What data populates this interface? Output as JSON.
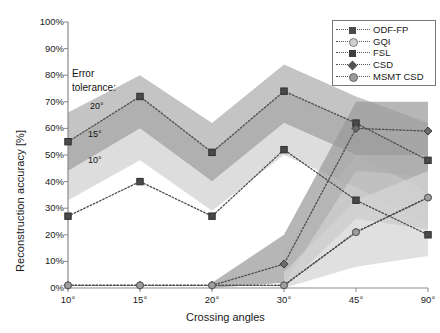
{
  "chart_data": {
    "type": "line",
    "title": "",
    "xlabel": "Crossing angles",
    "ylabel": "Reconstruction accuracy [%]",
    "categories": [
      "10°",
      "15°",
      "20°",
      "30°",
      "45°",
      "90°"
    ],
    "ylim": [
      0,
      100
    ],
    "yticks": [
      "0%",
      "10%",
      "20%",
      "30%",
      "40%",
      "50%",
      "60%",
      "70%",
      "80%",
      "90%",
      "100%"
    ],
    "ytick_values": [
      0,
      10,
      20,
      30,
      40,
      50,
      60,
      70,
      80,
      90,
      100
    ],
    "grid": false,
    "legend_position": "top-right",
    "series": [
      {
        "name": "ODF-FP",
        "marker": "square",
        "values": [
          55,
          72,
          51,
          74,
          62,
          48
        ]
      },
      {
        "name": "GQI",
        "marker": "circle",
        "values": [
          1,
          1,
          1,
          1,
          21,
          34
        ]
      },
      {
        "name": "FSL",
        "marker": "square",
        "values": [
          27,
          40,
          27,
          52,
          33,
          20
        ]
      },
      {
        "name": "CSD",
        "marker": "diamond",
        "values": [
          1,
          1,
          1,
          9,
          60,
          59
        ]
      },
      {
        "name": "MSMT CSD",
        "marker": "hexagon",
        "values": [
          1,
          1,
          1,
          1,
          21,
          34
        ]
      }
    ],
    "bands": [
      {
        "label": "20°",
        "upper": [
          66,
          80,
          62,
          84,
          72,
          62
        ],
        "lower": [
          55,
          72,
          51,
          74,
          62,
          48
        ]
      },
      {
        "label": "15°",
        "upper": [
          55,
          72,
          51,
          74,
          62,
          48
        ],
        "lower": [
          44,
          60,
          40,
          62,
          50,
          36
        ]
      },
      {
        "label": "10°",
        "upper": [
          44,
          60,
          40,
          62,
          50,
          36
        ],
        "lower": [
          33,
          48,
          29,
          50,
          38,
          24
        ]
      }
    ],
    "annotations": {
      "error_tolerance_line1": "Error",
      "error_tolerance_line2": "tolerance:",
      "band_20": "20°",
      "band_15": "15°",
      "band_10": "10°"
    },
    "colors": {
      "band_light": "#d4d4d4",
      "band_mid": "#b4b4b4",
      "band_dark": "#9a9a9a",
      "line": "#4d4d4d",
      "axis": "#8a8a8a"
    }
  },
  "legend": {
    "items": [
      {
        "label": "ODF-FP"
      },
      {
        "label": "GQI"
      },
      {
        "label": "FSL"
      },
      {
        "label": "CSD"
      },
      {
        "label": "MSMT CSD"
      }
    ]
  }
}
